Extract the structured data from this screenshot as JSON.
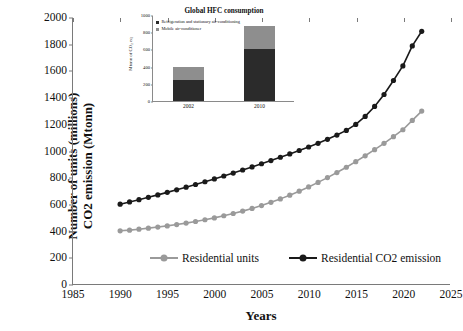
{
  "chart_data": [
    {
      "type": "line",
      "title": "",
      "xlabel": "Years",
      "ylabel": "Number of units (millions) CO2 emission (Mtonn)",
      "xlim": [
        1985,
        2025
      ],
      "ylim": [
        0,
        2000
      ],
      "xticks": [
        1985,
        1990,
        1995,
        2000,
        2005,
        2010,
        2015,
        2020,
        2025
      ],
      "yticks": [
        0,
        200,
        400,
        600,
        800,
        1000,
        1200,
        1400,
        1600,
        1800,
        2000
      ],
      "grid": false,
      "legend_position": "bottom",
      "x": [
        1990,
        1991,
        1992,
        1993,
        1994,
        1995,
        1996,
        1997,
        1998,
        1999,
        2000,
        2001,
        2002,
        2003,
        2004,
        2005,
        2006,
        2007,
        2008,
        2009,
        2010,
        2011,
        2012,
        2013,
        2014,
        2015,
        2016,
        2017,
        2018,
        2019,
        2020,
        2021,
        2022
      ],
      "series": [
        {
          "name": "Residential units",
          "color": "#9a9a9a",
          "marker": "circle",
          "values": [
            400,
            405,
            412,
            420,
            428,
            437,
            447,
            458,
            470,
            483,
            497,
            513,
            530,
            548,
            568,
            590,
            614,
            640,
            668,
            698,
            730,
            764,
            800,
            838,
            878,
            920,
            964,
            1010,
            1058,
            1108,
            1160,
            1230,
            1300
          ]
        },
        {
          "name": "Residential CO2 emission",
          "color": "#1a1a1a",
          "marker": "circle",
          "values": [
            600,
            617,
            634,
            652,
            670,
            689,
            708,
            728,
            748,
            769,
            790,
            812,
            834,
            857,
            880,
            904,
            928,
            953,
            978,
            1004,
            1030,
            1058,
            1088,
            1120,
            1155,
            1200,
            1260,
            1335,
            1425,
            1530,
            1640,
            1790,
            1900
          ]
        }
      ]
    },
    {
      "type": "bar",
      "stacked": true,
      "title": "Global HFC consumption",
      "xlabel": "",
      "ylabel": "Mtonn of CO₂ eq",
      "categories": [
        "2002",
        "2010"
      ],
      "ylim": [
        0,
        1000
      ],
      "yticks": [
        0,
        200,
        400,
        600,
        800,
        1000
      ],
      "grid": false,
      "legend_position": "top",
      "series": [
        {
          "name": "Refrigeration and stationary air-conditioning",
          "color": "#2b2b2b",
          "values": [
            250,
            600
          ]
        },
        {
          "name": "Mobile air-conditioner",
          "color": "#8e8e8e",
          "values": [
            150,
            270
          ]
        }
      ]
    }
  ],
  "main": {
    "ylabel_line1": "Number of units (millions)",
    "ylabel_line2": "CO2 emission (Mtonn)",
    "xlabel": "Years",
    "yticks": [
      "2000",
      "1800",
      "1600",
      "1400",
      "1200",
      "1000",
      "800",
      "600",
      "400",
      "200",
      "0"
    ],
    "xticks": [
      "1985",
      "1990",
      "1995",
      "2000",
      "2005",
      "2010",
      "2015",
      "2020",
      "2025"
    ],
    "legend": [
      {
        "label": "Residential units",
        "color": "#9a9a9a"
      },
      {
        "label": "Residential CO2 emission",
        "color": "#1a1a1a"
      }
    ]
  },
  "inset": {
    "title": "Global HFC consumption",
    "ylabel": "Mtonn of CO₂ eq",
    "yticks": [
      "1000",
      "800",
      "600",
      "400",
      "200",
      "0"
    ],
    "xticks": [
      "2002",
      "2010"
    ],
    "legend": [
      {
        "label": "Refrigeration and stationary air-conditioning",
        "color": "#2b2b2b"
      },
      {
        "label": "Mobile air-conditioner",
        "color": "#8e8e8e"
      }
    ]
  }
}
